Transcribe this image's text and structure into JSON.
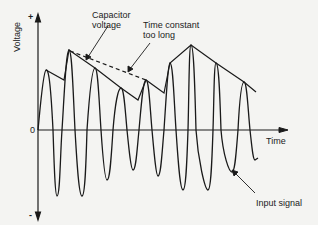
{
  "diagram": {
    "axes": {
      "y_label": "Voltage",
      "x_label": "Time",
      "y_plus": "+",
      "y_minus": "-",
      "origin": "0"
    },
    "annotations": {
      "capacitor_voltage_line1": "Capacitor",
      "capacitor_voltage_line2": "voltage",
      "time_constant_line1": "Time constant",
      "time_constant_line2": "too long",
      "input_signal": "Input signal"
    },
    "colors": {
      "stroke": "#1a1a1a",
      "background": "#f4f4f2"
    }
  }
}
